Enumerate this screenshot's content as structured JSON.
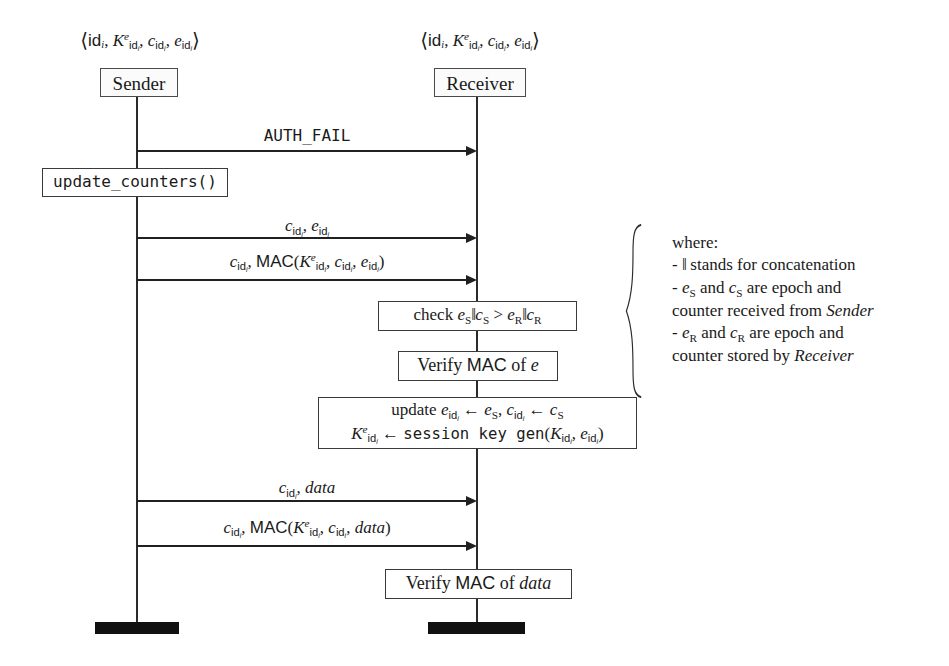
{
  "diagram": {
    "actors": [
      {
        "id": "sender",
        "label": "Sender",
        "state": "⟨id_i, K^e_id_i, c_id_i, e_id_i⟩"
      },
      {
        "id": "receiver",
        "label": "Receiver",
        "state": "⟨id_i, K^e_id_i, c_id_i, e_id_i⟩"
      }
    ],
    "messages": [
      {
        "id": "auth-fail",
        "label": "AUTH_FAIL",
        "from": "sender",
        "to": "receiver",
        "style": "mono"
      },
      {
        "id": "counters",
        "label": "c_id_i, e_id_i",
        "from": "sender",
        "to": "receiver",
        "style": "math"
      },
      {
        "id": "counters-mac",
        "label": "c_id_i, MAC(K^e_id_i, c_id_i, e_id_i)",
        "from": "sender",
        "to": "receiver",
        "style": "math"
      },
      {
        "id": "data",
        "label": "c_id_i, data",
        "from": "sender",
        "to": "receiver",
        "style": "math"
      },
      {
        "id": "data-mac",
        "label": "c_id_i, MAC(K^e_id_i, c_id_i, data)",
        "from": "sender",
        "to": "receiver",
        "style": "math"
      }
    ],
    "process_boxes": [
      {
        "id": "update-counters",
        "owner": "sender",
        "label": "update_counters()",
        "style": "mono"
      },
      {
        "id": "check-epoch",
        "owner": "receiver",
        "label": "check e_S‖c_S > e_R‖c_R",
        "style": "math"
      },
      {
        "id": "verify-mac-e",
        "owner": "receiver",
        "label": "Verify MAC of e",
        "style": "math"
      },
      {
        "id": "update-state",
        "owner": "receiver",
        "label_line1": "update e_id_i ← e_S, c_id_i ← c_S",
        "label_line2": "K^e_id_i ← session key gen(K_id_i, e_id_i)",
        "style": "math"
      },
      {
        "id": "verify-mac-data",
        "owner": "receiver",
        "label": "Verify MAC of data",
        "style": "math"
      }
    ],
    "legend": {
      "heading": "where:",
      "items": [
        "- ‖ stands for concatenation",
        "- e_S and c_S are epoch and counter received from Sender",
        "- e_R and c_R are epoch and counter stored by Receiver"
      ]
    },
    "colors": {
      "line": "#202020",
      "box_border": "#3a3a3a",
      "actor_fill": "#fbfbfb",
      "termination_bar": "#101010",
      "background": "#ffffff"
    }
  }
}
